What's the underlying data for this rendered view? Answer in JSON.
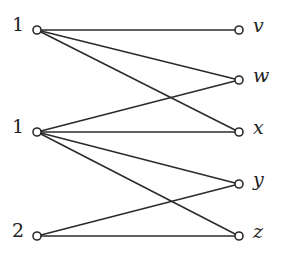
{
  "diagram": {
    "type": "bipartite-graph",
    "left_nodes": [
      {
        "id": "L1",
        "label": "1",
        "x": 37,
        "y": 30
      },
      {
        "id": "L2",
        "label": "1",
        "x": 37,
        "y": 132
      },
      {
        "id": "L3",
        "label": "2",
        "x": 37,
        "y": 236
      }
    ],
    "right_nodes": [
      {
        "id": "v",
        "label": "v",
        "x": 239,
        "y": 30
      },
      {
        "id": "w",
        "label": "w",
        "x": 239,
        "y": 80
      },
      {
        "id": "x",
        "label": "x",
        "x": 239,
        "y": 132
      },
      {
        "id": "y",
        "label": "y",
        "x": 239,
        "y": 184
      },
      {
        "id": "z",
        "label": "z",
        "x": 239,
        "y": 236
      }
    ],
    "edges": [
      [
        "L1",
        "v"
      ],
      [
        "L1",
        "w"
      ],
      [
        "L1",
        "x"
      ],
      [
        "L2",
        "w"
      ],
      [
        "L2",
        "x"
      ],
      [
        "L2",
        "y"
      ],
      [
        "L2",
        "z"
      ],
      [
        "L3",
        "y"
      ],
      [
        "L3",
        "z"
      ]
    ],
    "colors": {
      "stroke": "#2a2a2a",
      "node_fill": "#ffffff",
      "background": "#ffffff"
    }
  }
}
